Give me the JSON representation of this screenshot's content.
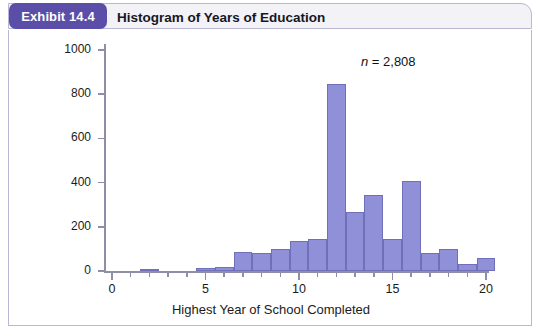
{
  "header": {
    "badge": "Exhibit 14.4",
    "title": "Histogram of Years of Education"
  },
  "annotation": {
    "prefix": "n",
    "text": " = 2,808",
    "full": "n = 2,808"
  },
  "colors": {
    "badge_purple": "#5b4ea8",
    "bar_fill": "#9090d8",
    "bar_stroke": "#6f6fba",
    "frame_border": "#b9b7d4",
    "axis": "#8e8ea8",
    "header_strip": "#f2f2f7"
  },
  "chart_data": {
    "type": "bar",
    "title": "Histogram of Years of Education",
    "xlabel": "Highest Year of School Completed",
    "ylabel": "",
    "xlim": [
      -0.5,
      20.5
    ],
    "ylim": [
      0,
      1000
    ],
    "grid": false,
    "legend": null,
    "annotations": [
      "n = 2,808"
    ],
    "n": 2808,
    "bin_width": 1,
    "x_major_ticks": [
      0,
      5,
      10,
      15,
      20
    ],
    "x_minor_ticks": [
      1,
      2,
      3,
      4,
      6,
      7,
      8,
      9,
      11,
      12,
      13,
      14,
      16,
      17,
      18,
      19
    ],
    "xtick_labels": [
      "0",
      "5",
      "10",
      "15",
      "20"
    ],
    "y_ticks": [
      0,
      200,
      400,
      600,
      800,
      1000
    ],
    "ytick_labels": [
      "0",
      "200",
      "400",
      "600",
      "800",
      "1000"
    ],
    "categories": [
      0,
      1,
      2,
      3,
      4,
      5,
      6,
      7,
      8,
      9,
      10,
      11,
      12,
      13,
      14,
      15,
      16,
      17,
      18,
      19,
      20
    ],
    "values": [
      0,
      0,
      10,
      0,
      0,
      15,
      20,
      85,
      80,
      100,
      135,
      145,
      845,
      265,
      345,
      145,
      405,
      80,
      100,
      30,
      60
    ]
  }
}
